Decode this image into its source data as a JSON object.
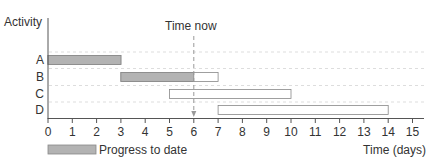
{
  "chart_data": {
    "type": "gantt",
    "title": "",
    "ylabel": "Activity",
    "xlabel": "Time (days)",
    "xlim": [
      0,
      15
    ],
    "xticks": [
      0,
      1,
      2,
      3,
      4,
      5,
      6,
      7,
      8,
      9,
      10,
      11,
      12,
      13,
      14,
      15
    ],
    "time_now": 6,
    "time_now_label": "Time now",
    "grid": "horizontal dashed between rows",
    "activities": [
      {
        "name": "A",
        "start": 0,
        "end": 3,
        "progress_to": 3
      },
      {
        "name": "B",
        "start": 3,
        "end": 7,
        "progress_to": 6
      },
      {
        "name": "C",
        "start": 5,
        "end": 10,
        "progress_to": null
      },
      {
        "name": "D",
        "start": 7,
        "end": 14,
        "progress_to": null
      }
    ],
    "legend": [
      {
        "label": "Progress to date",
        "fill": "#b3b3b3"
      }
    ],
    "legend_position": "bottom-left"
  },
  "labels": {
    "ylabel": "Activity",
    "xlabel": "Time (days)",
    "time_now": "Time now",
    "legend_progress": "Progress to date",
    "activities": [
      "A",
      "B",
      "C",
      "D"
    ],
    "ticks": [
      "0",
      "1",
      "2",
      "3",
      "4",
      "5",
      "6",
      "7",
      "8",
      "9",
      "10",
      "11",
      "12",
      "13",
      "14",
      "15"
    ]
  },
  "colors": {
    "progress_fill": "#b3b3b3",
    "bar_stroke": "#888888",
    "axis": "#555555",
    "grid": "#dddddd"
  }
}
